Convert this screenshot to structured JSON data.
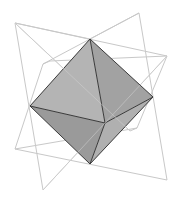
{
  "diagram": {
    "colors": {
      "background": "#ffffff",
      "wire": "#c8c8c8",
      "edge": "#3a3a3a",
      "face_top_left": "#b4b4b4",
      "face_top_right": "#a2a2a2",
      "face_bottom_left": "#9a9a9a",
      "face_bottom_right": "#b0b0b0",
      "face_front_lower": "#a8a8a8"
    },
    "octahedron": {
      "vertices": {
        "top": [
          90,
          39
        ],
        "left": [
          30,
          106
        ],
        "right": [
          153,
          97
        ],
        "bottom": [
          90,
          164
        ],
        "front": [
          105,
          123
        ]
      }
    },
    "wireframe": {
      "vertices": {
        "tl": [
          15,
          23
        ],
        "tr": [
          139,
          13
        ],
        "r": [
          167,
          56
        ],
        "br": [
          167,
          180
        ],
        "b": [
          43,
          190
        ],
        "bl": [
          15,
          149
        ],
        "in_l": [
          43,
          64
        ],
        "in_l2": [
          50,
          61
        ],
        "in_r": [
          137,
          128
        ],
        "in_r2": [
          130,
          131
        ]
      }
    }
  }
}
